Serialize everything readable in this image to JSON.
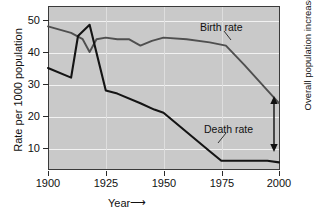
{
  "chart_data": {
    "type": "line",
    "title": "",
    "xlabel": "Year",
    "ylabel": "Rate per 1000 population",
    "xlim": [
      1900,
      2000
    ],
    "ylim": [
      0,
      54
    ],
    "grid": true,
    "legend_position": "inline-annotations",
    "xticks": [
      "1900",
      "1925",
      "1950",
      "1975",
      "2000"
    ],
    "xtick_values": [
      1900,
      1925,
      1950,
      1975,
      2000
    ],
    "yticks": [
      "10",
      "20",
      "30",
      "40",
      "50"
    ],
    "ytick_values": [
      10,
      20,
      30,
      40,
      50
    ],
    "series": [
      {
        "name": "Birth rate",
        "x": [
          1900,
          1910,
          1915,
          1918,
          1921,
          1925,
          1930,
          1935,
          1940,
          1945,
          1950,
          1960,
          1970,
          1977,
          1985,
          1995,
          2000
        ],
        "values": [
          48,
          46,
          44,
          40,
          44,
          44.5,
          44,
          44,
          42,
          43.5,
          44.5,
          44,
          43,
          42,
          36,
          28,
          24
        ]
      },
      {
        "name": "Death rate",
        "x": [
          1900,
          1910,
          1913,
          1918,
          1925,
          1930,
          1940,
          1946,
          1950,
          1960,
          1970,
          1975,
          1985,
          1995,
          2000
        ],
        "values": [
          35,
          32,
          45,
          48.5,
          28,
          27,
          24,
          22,
          21,
          15,
          9,
          6,
          6,
          6,
          5.5
        ]
      }
    ],
    "annotations": [
      {
        "name": "Overall population increase",
        "text_lines": [
          "Overall",
          "population",
          "increase"
        ],
        "at_x": 2000,
        "from_value": 6,
        "to_value": 24,
        "style": "double-headed-arrow"
      }
    ],
    "colors": {
      "plot_background": "#c9c9c9",
      "gridline": "#f2f2f2",
      "birth_rate_line": "#4a4a4a",
      "death_rate_line": "#1a1a1a",
      "axis": "#3a3a3a",
      "text": "#111111",
      "page_background": "#ffffff"
    }
  },
  "axis": {
    "x_label_text": "Year",
    "x_label_arrow": "⟶",
    "y_label_text": "Rate per 1000 population"
  },
  "labels": {
    "birth_rate": "Birth rate",
    "death_rate": "Death rate",
    "overall_line1": "Overall",
    "overall_line2": "population",
    "overall_line3": "increase"
  }
}
